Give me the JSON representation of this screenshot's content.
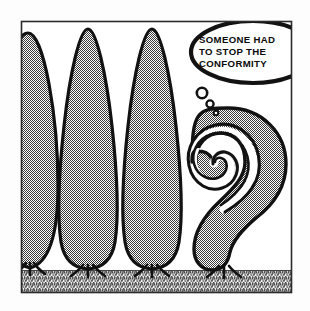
{
  "panel": {
    "title": "Conformity cartoon panel",
    "caption_lines": [
      "SOMEONE HAD",
      "TO STOP THE",
      "CONFORMITY"
    ],
    "caption_full": "SOMEONE HAD TO STOP THE CONFORMITY",
    "frame": {
      "x": 21,
      "y": 21,
      "width": 271,
      "height": 272,
      "border_color": "#2b2b2b"
    },
    "colors": {
      "paper": "#fdfdfd",
      "ink": "#111111",
      "foliage_fill": "#9a9a9a",
      "ground_fill": "#a6a6a6",
      "bubble_fill": "#ffffff"
    },
    "trees": [
      {
        "name": "cypress-tree-1",
        "label": "conforming cypress (clipped at left edge)",
        "tip_x": 28,
        "tip_y": 24,
        "trunk_x": 30
      },
      {
        "name": "cypress-tree-2",
        "label": "conforming cypress",
        "tip_x": 88,
        "tip_y": 29,
        "trunk_x": 88
      },
      {
        "name": "cypress-tree-3",
        "label": "conforming cypress",
        "tip_x": 152,
        "tip_y": 29,
        "trunk_x": 152
      },
      {
        "name": "spiral-tree",
        "label": "nonconforming spiral tree",
        "tip_x": 228,
        "tip_y": 108,
        "trunk_x": 224
      }
    ],
    "thought_dots": [
      {
        "cx": 202,
        "cy": 93,
        "r": 5.2
      },
      {
        "cx": 210,
        "cy": 104,
        "r": 3.6
      },
      {
        "cx": 216,
        "cy": 113,
        "r": 2.3
      }
    ],
    "speech_bubble": {
      "cx": 253,
      "cy": 52,
      "rx": 62,
      "ry": 31,
      "stroke_width": 4.2
    },
    "ground": {
      "top_y": 270,
      "bottom_y": 292,
      "texture": "stippled-hatch"
    }
  }
}
